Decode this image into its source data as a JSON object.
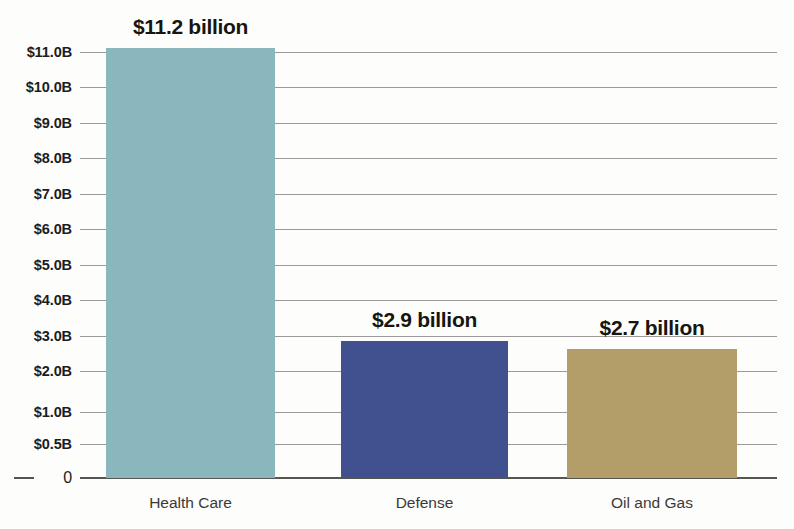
{
  "chart_data": {
    "type": "bar",
    "title": "",
    "subtitle": "",
    "xlabel": "",
    "ylabel": "",
    "categories": [
      "Health Care",
      "Defense",
      "Oil and Gas"
    ],
    "values": [
      11.2,
      2.9,
      2.7
    ],
    "value_labels": [
      "$11.2 billion",
      "$2.9 billion",
      "$2.7 billion"
    ],
    "unit": "billion USD",
    "colors": [
      "#8ab7bd",
      "#41508f",
      "#b39d68"
    ],
    "grid": true,
    "legend": false,
    "legend_position": "none",
    "ylim": [
      0,
      11.2
    ],
    "y_tick_labels": [
      "$11.0B",
      "$10.0B",
      "$9.0B",
      "$8.0B",
      "$7.0B",
      "$6.0B",
      "$5.0B",
      "$4.0B",
      "$3.0B",
      "$2.0B",
      "$1.0B",
      "$0.5B",
      "0"
    ],
    "y_tick_values": [
      11.0,
      10.0,
      9.0,
      8.0,
      7.0,
      6.0,
      5.0,
      4.0,
      3.0,
      2.0,
      1.0,
      0.5,
      0
    ],
    "y_tick_pixels": [
      52,
      87,
      123,
      158,
      194,
      229,
      265,
      300,
      336,
      371,
      412,
      444,
      478
    ],
    "bars": [
      {
        "category": "Health Care",
        "value": 11.2,
        "label": "$11.2 billion",
        "color": "#8ab7bd",
        "left": 106,
        "width": 169,
        "top": 48
      },
      {
        "category": "Defense",
        "value": 2.9,
        "label": "$2.9 billion",
        "color": "#41508f",
        "left": 341,
        "width": 167,
        "top": 341
      },
      {
        "category": "Oil and Gas",
        "value": 2.7,
        "label": "$2.7 billion",
        "color": "#b39d68",
        "left": 567,
        "width": 170,
        "top": 349
      }
    ],
    "axis_colors": {
      "gridline": "#9a9a9a",
      "baseline": "#555552",
      "tick_text": "#1c1c1c",
      "category_text": "#3a3a38"
    }
  }
}
